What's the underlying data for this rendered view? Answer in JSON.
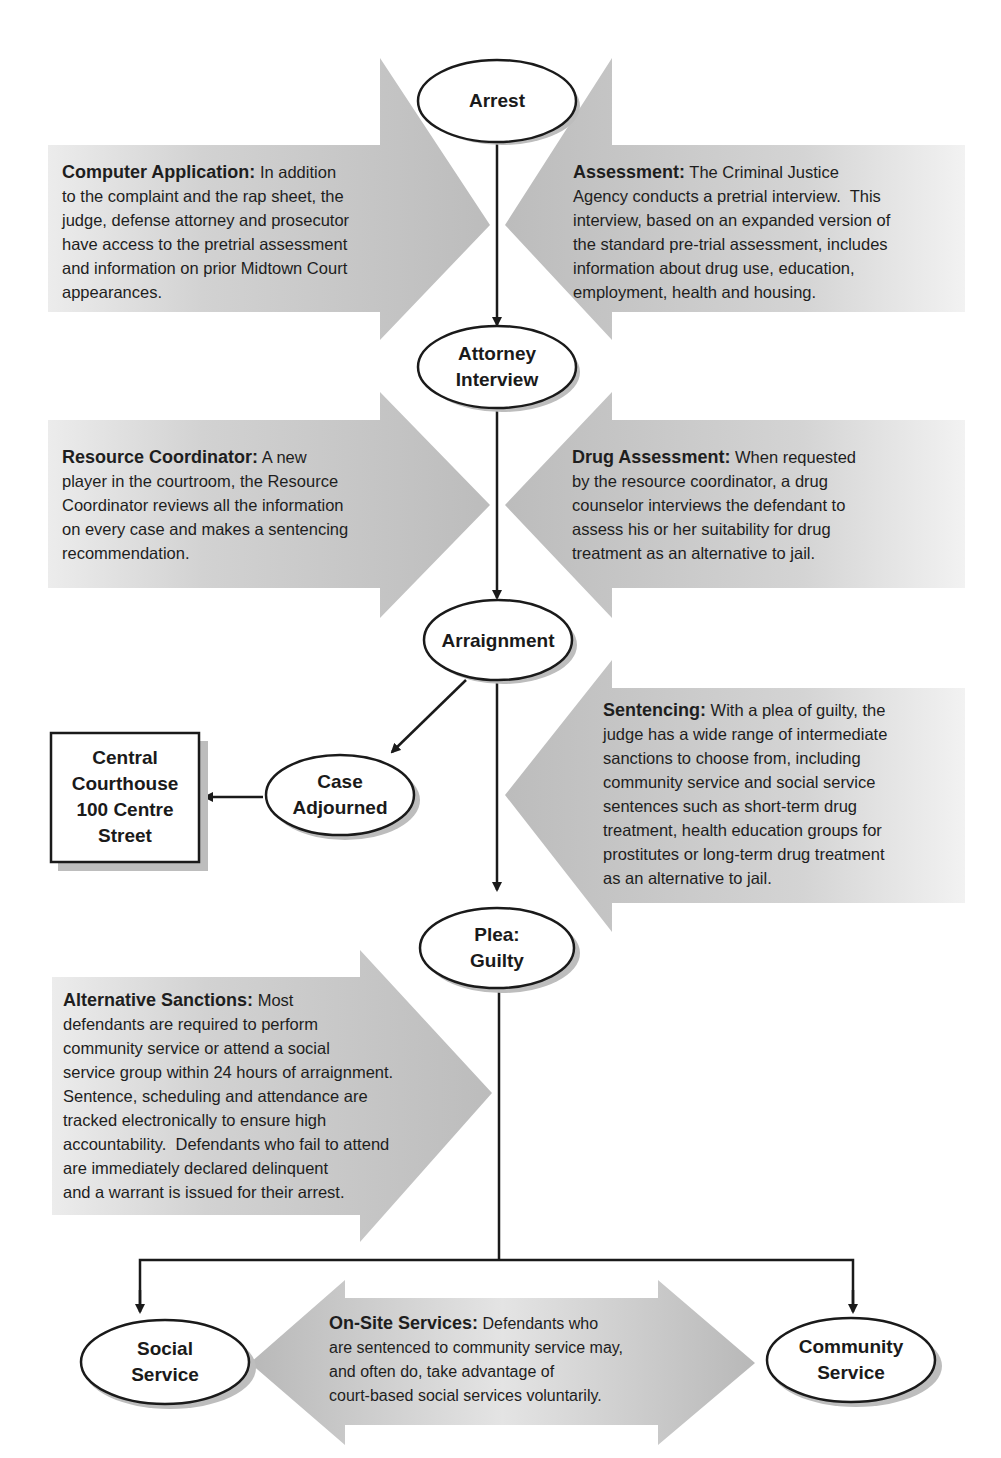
{
  "colors": {
    "arrow_fill": "#c4c4c4",
    "arrow_fill_light": "#e8e8e8",
    "node_border": "#1a1a1a",
    "node_shadow": "#bdbdbd",
    "text": "#1a1a1a"
  },
  "nodes": {
    "arrest": {
      "label": "Arrest"
    },
    "attorney_interview": {
      "line1": "Attorney",
      "line2": "Interview"
    },
    "arraignment": {
      "label": "Arraignment"
    },
    "case_adjourned": {
      "line1": "Case",
      "line2": "Adjourned"
    },
    "central_courthouse": {
      "line1": "Central",
      "line2": "Courthouse",
      "line3": "100 Centre",
      "line4": "Street"
    },
    "plea_guilty": {
      "line1": "Plea:",
      "line2": "Guilty"
    },
    "social_service": {
      "line1": "Social",
      "line2": "Service"
    },
    "community_service": {
      "line1": "Community",
      "line2": "Service"
    }
  },
  "callouts": {
    "computer_application": {
      "title": "Computer Application:",
      "lines": [
        " In addition",
        "to the complaint and the rap sheet, the",
        "judge, defense attorney and prosecutor",
        "have access to the pretrial assessment",
        "and information on prior Midtown Court",
        "appearances."
      ]
    },
    "assessment": {
      "title": "Assessment:",
      "lines": [
        " The Criminal Justice",
        "Agency conducts a pretrial interview.  This",
        "interview, based on an expanded version of",
        "the standard pre-trial assessment, includes",
        "information about drug use, education,",
        "employment, health and housing."
      ]
    },
    "resource_coordinator": {
      "title": "Resource Coordinator:",
      "lines": " A new|player in the courtroom, the Resource|Coordinator reviews all the information|on every case and makes a sentencing|recommendation."
    },
    "drug_assessment": {
      "title": "Drug Assessment:",
      "lines": " When requested|by the resource coordinator, a drug|counselor interviews the defendant to|assess his or her suitability for drug|treatment as an alternative to jail."
    },
    "sentencing": {
      "title": "Sentencing:",
      "lines": " With a plea of guilty, the|judge has a wide range of intermediate|sanctions to choose from, including|community service and social service|sentences such as short-term drug|treatment, health education groups for|prostitutes or long-term drug treatment|as an alternative to jail."
    },
    "alternative_sanctions": {
      "title": "Alternative Sanctions:",
      "lines": " Most|defendants are required to perform|community service or attend a social|service group within 24 hours of arraignment.|Sentence, scheduling and attendance are|tracked electronically to ensure high|accountability.  Defendants who fail to attend|are immediately declared delinquent|and a warrant is issued for their arrest."
    },
    "on_site_services": {
      "title": "On-Site Services:",
      "lines": " Defendants who|are sentenced to community service may,|and often do, take advantage of|court-based social services voluntarily."
    }
  }
}
